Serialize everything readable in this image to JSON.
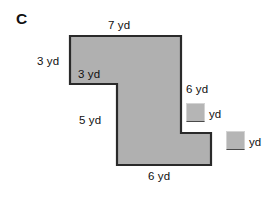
{
  "figure": {
    "part_letter": "C",
    "unit": "yd",
    "shape_fill": "#b0b0b0",
    "shape_stroke": "#2a2a2a",
    "background": "#ffffff",
    "labels": {
      "top": "7 yd",
      "left_outer": "3 yd",
      "inner_top_left": "3 yd",
      "right": "6 yd",
      "left_stem": "5 yd",
      "bottom": "6 yd"
    },
    "answer_boxes": [
      {
        "value": "",
        "unit": "yd"
      },
      {
        "value": "",
        "unit": "yd"
      }
    ],
    "polygon_points": "70,36 181,36 181,133 211,133 211,165 117,165 117,84 70,84"
  }
}
